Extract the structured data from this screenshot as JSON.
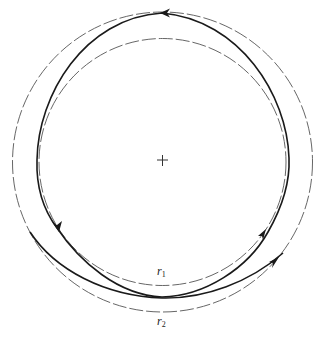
{
  "figure": {
    "center_marker": "+",
    "circles": [
      {
        "name": "r1",
        "label": "r",
        "subscript": "1",
        "style": "dashed",
        "radius_px": 124
      },
      {
        "name": "r2",
        "label": "r",
        "subscript": "2",
        "style": "dashed",
        "radius_px": 150
      }
    ],
    "orbit": {
      "style": "solid",
      "direction": "counterclockwise",
      "arrow_count": 4
    },
    "colors": {
      "background": "#ffffff",
      "line": "#1a1a1a",
      "dashed": "#555555"
    }
  }
}
